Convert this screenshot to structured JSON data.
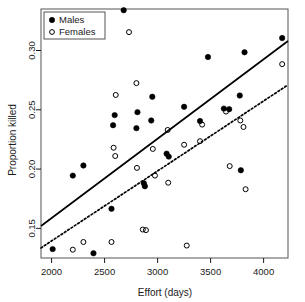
{
  "chart_data": {
    "type": "scatter",
    "title": "",
    "xlabel": "Effort (days)",
    "ylabel": "Proportion killed",
    "xlim": [
      1900,
      4230
    ],
    "ylim": [
      0.125,
      0.335
    ],
    "xticks": [
      2000,
      2500,
      3000,
      3500,
      4000
    ],
    "xtick_labels": [
      "2000",
      "2500",
      "3000",
      "3500",
      "4000"
    ],
    "yticks": [
      0.15,
      0.2,
      0.25,
      0.3
    ],
    "ytick_labels": [
      "0.15",
      "0.20",
      "0.25",
      "0.30"
    ],
    "grid": false,
    "legend_position": "top-left",
    "legend": [
      {
        "label": "Males",
        "marker": "filled-circle",
        "color": "#000000"
      },
      {
        "label": "Females",
        "marker": "open-circle",
        "color": "#000000"
      }
    ],
    "series": [
      {
        "name": "Males",
        "marker": "filled-circle",
        "color": "#000000",
        "points": [
          [
            2010,
            0.1325
          ],
          [
            2200,
            0.1945
          ],
          [
            2300,
            0.203
          ],
          [
            2395,
            0.129
          ],
          [
            2565,
            0.1665
          ],
          [
            2580,
            0.237
          ],
          [
            2595,
            0.2455
          ],
          [
            2680,
            0.334
          ],
          [
            2800,
            0.2345
          ],
          [
            2810,
            0.248
          ],
          [
            2870,
            0.188
          ],
          [
            2880,
            0.1855
          ],
          [
            2940,
            0.241
          ],
          [
            2950,
            0.261
          ],
          [
            3085,
            0.213
          ],
          [
            3105,
            0.2105
          ],
          [
            3250,
            0.2525
          ],
          [
            3400,
            0.2405
          ],
          [
            3475,
            0.2945
          ],
          [
            3625,
            0.251
          ],
          [
            3675,
            0.2505
          ],
          [
            3775,
            0.262
          ],
          [
            3785,
            0.199
          ],
          [
            3820,
            0.2985
          ],
          [
            4175,
            0.3105
          ]
        ]
      },
      {
        "name": "Females",
        "marker": "open-circle",
        "color": "#000000",
        "points": [
          [
            2200,
            0.132
          ],
          [
            2300,
            0.1385
          ],
          [
            2565,
            0.1385
          ],
          [
            2585,
            0.218
          ],
          [
            2600,
            0.211
          ],
          [
            2605,
            0.2625
          ],
          [
            2730,
            0.3155
          ],
          [
            2800,
            0.2725
          ],
          [
            2805,
            0.201
          ],
          [
            2860,
            0.149
          ],
          [
            2890,
            0.1485
          ],
          [
            2955,
            0.217
          ],
          [
            2975,
            0.1945
          ],
          [
            3095,
            0.233
          ],
          [
            3100,
            0.1885
          ],
          [
            3250,
            0.2205
          ],
          [
            3275,
            0.1355
          ],
          [
            3400,
            0.2235
          ],
          [
            3420,
            0.2375
          ],
          [
            3645,
            0.2485
          ],
          [
            3680,
            0.2025
          ],
          [
            3780,
            0.241
          ],
          [
            3810,
            0.2355
          ],
          [
            3830,
            0.183
          ],
          [
            4175,
            0.2885
          ]
        ]
      }
    ],
    "trend_lines": [
      {
        "name": "Males fit",
        "style": "solid",
        "color": "#000000",
        "x1": 1900,
        "y1": 0.152,
        "x2": 4230,
        "y2": 0.308
      },
      {
        "name": "Females fit",
        "style": "dotted",
        "color": "#000000",
        "x1": 1900,
        "y1": 0.1335,
        "x2": 4230,
        "y2": 0.271
      }
    ]
  }
}
